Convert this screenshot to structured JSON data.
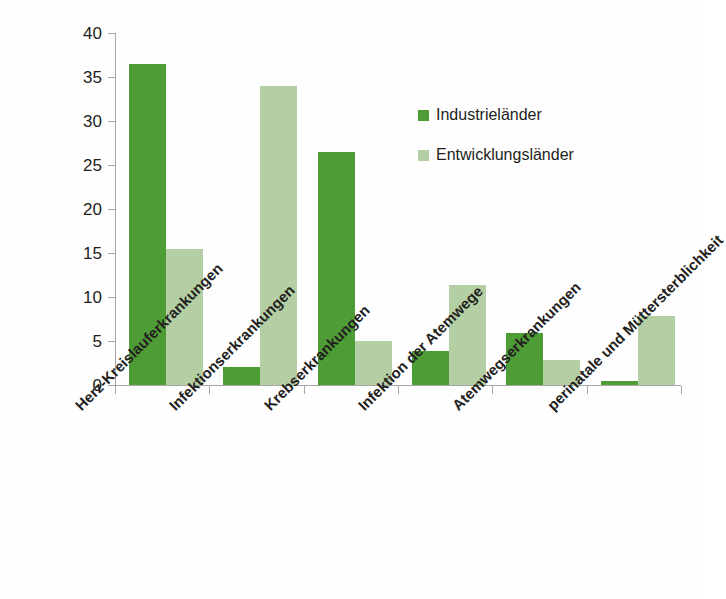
{
  "chart_data": {
    "type": "bar",
    "title": "",
    "xlabel": "",
    "ylabel": "",
    "ylim": [
      0,
      40
    ],
    "yticks": [
      0,
      5,
      10,
      15,
      20,
      25,
      30,
      35,
      40
    ],
    "grid": false,
    "legend_position": "inside-top-right",
    "categories": [
      "Herz-Kreislauferkrankungen",
      "Infektionserkrankungen",
      "Krebserkrankungen",
      "Infektion der Atemwege",
      "Atemwegserkrankungen",
      "perinatale und Müttersterblichkeit"
    ],
    "series": [
      {
        "name": "Industrieländer",
        "color": "#4e9c36",
        "values": [
          36.5,
          2.0,
          26.5,
          3.9,
          5.9,
          0.4
        ]
      },
      {
        "name": "Entwicklungsländer",
        "color": "#b5cfa5",
        "values": [
          15.4,
          34.0,
          5.0,
          11.4,
          2.8,
          7.8
        ]
      }
    ]
  },
  "colors": {
    "series_dark": "#4e9c36",
    "series_light": "#b5cfa5",
    "axis": "#a6a6a6",
    "text": "#231f20",
    "background": "#fefefe"
  },
  "axis": {
    "y_tick_labels": [
      "0",
      "5",
      "10",
      "15",
      "20",
      "25",
      "30",
      "35",
      "40"
    ]
  },
  "legend": {
    "items": [
      {
        "label": "Industrieländer"
      },
      {
        "label": "Entwicklungsländer"
      }
    ]
  }
}
